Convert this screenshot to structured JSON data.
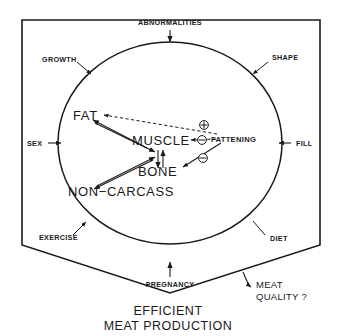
{
  "figure": {
    "title_line1": "EFFICIENT",
    "title_line2": "MEAT PRODUCTION",
    "outer_factors": [
      {
        "id": "abnormalities",
        "label": "ABNORMALITIES"
      },
      {
        "id": "growth",
        "label": "GROWTH"
      },
      {
        "id": "shape",
        "label": "SHAPE"
      },
      {
        "id": "sex",
        "label": "SEX"
      },
      {
        "id": "fill",
        "label": "FILL"
      },
      {
        "id": "exercise",
        "label": "EXERCISE"
      },
      {
        "id": "diet",
        "label": "DIET"
      },
      {
        "id": "pregnancy",
        "label": "PREGNANCY"
      }
    ],
    "inner_components": [
      {
        "id": "fat",
        "label": "FAT"
      },
      {
        "id": "muscle",
        "label": "MUSCLE"
      },
      {
        "id": "bone",
        "label": "BONE"
      },
      {
        "id": "non_carcass",
        "label": "NON−CARCASS"
      }
    ],
    "driver": {
      "id": "fattening",
      "label": "FATTENING"
    },
    "signs": [
      {
        "id": "fattening-to-fat",
        "symbol": "+",
        "target": "FAT"
      },
      {
        "id": "fattening-to-muscle",
        "symbol": "−",
        "target": "MUSCLE"
      },
      {
        "id": "fattening-to-bone",
        "symbol": "−",
        "target": "BONE"
      }
    ],
    "outcome": {
      "line1": "MEAT",
      "line2": "QUALITY ?"
    },
    "colors": {
      "ink": "#1a1a1a",
      "background": "#ffffff"
    }
  }
}
